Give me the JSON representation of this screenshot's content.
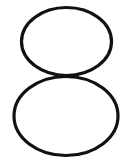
{
  "image": {
    "content": "8",
    "description": "Handwritten-style digit eight drawn as two stacked black ellipse outlines on white",
    "stroke_color": "#111111",
    "background_color": "#ffffff"
  }
}
